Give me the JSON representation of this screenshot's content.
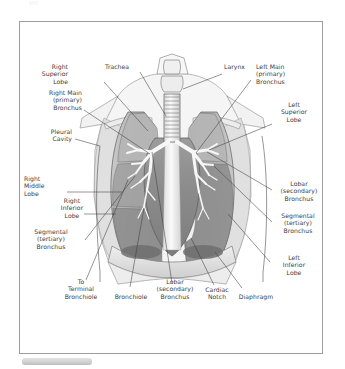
{
  "figure": {
    "style": "grayscale medical illustration with leader-line callouts",
    "border_color": "#9d9d9d",
    "background_color": "#ffffff",
    "text_color": "#3b3b3b"
  },
  "labels": {
    "right_superior_lobe": "Right\nSuperior\nLobe",
    "trachea": "Trachea",
    "larynx": "Larynx",
    "left_main_bronchus": "Left Main\n(primary)\nBronchus",
    "right_main_bronchus": "Right Main\n(primary)\nBronchus",
    "left_superior_lobe": "Left\nSuperior\nLobe",
    "pleural_cavity": "Pleural\nCavity",
    "right_middle_lobe": "Right\nMiddle\nLobe",
    "right_inferior_lobe": "Right\nInferior\nLobe",
    "lobar_bronchus_right": "Lobar\n(secondary)\nBronchus",
    "segmental_bronchus_right": "Segmental\n(tertiary)\nBronchus",
    "segmental_bronchus_left": "Segmental\n(tertiary)\nBronchus",
    "left_inferior_lobe": "Left\nInferior\nLobe",
    "to_terminal_bronchiole": "To\nTerminal\nBronchiole",
    "bronchiole": "Bronchiole",
    "lobar_bronchus_bottom": "Lobar\n(secondary)\nBronchus",
    "cardiac_notch": "Cardiac\nNotch",
    "diaphragm": "Diaphragm"
  },
  "colors": {
    "lung_light": "#c8c8c8",
    "lung_mid": "#a9a9a9",
    "lung_dark": "#8c8c8c",
    "pleura": "#e2e2e2",
    "bronchi_white": "#f6f6f6",
    "diaphragm_dark": "#6f6f6f",
    "outline": "#4a4a4a",
    "leader_line": "#3f3f3f"
  }
}
